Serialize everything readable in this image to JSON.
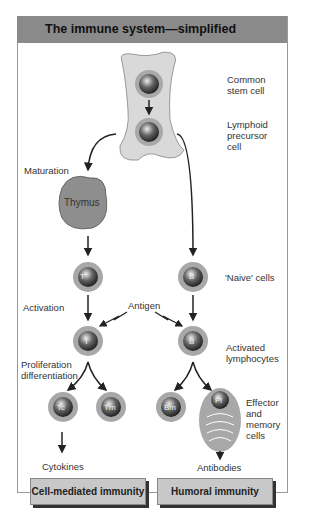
{
  "title": "The immune system—simplified",
  "labels": {
    "common_stem": "Common\nstem cell",
    "lymphoid": "Lymphoid\nprecursor\ncell",
    "maturation": "Maturation",
    "thymus": "Thymus",
    "naive": "'Naive' cells",
    "activation": "Activation",
    "antigen": "Antigen",
    "activated": "Activated\nlymphocytes",
    "proliferation": "Proliferation\ndifferentiation",
    "effector": "Effector\nand\nmemory\ncells",
    "cytokines": "Cytokines",
    "antibodies": "Antibodies"
  },
  "cells": {
    "t": "T",
    "b": "B",
    "tc": "Tc",
    "tm": "Tm",
    "bm": "Bm",
    "pl": "Pl"
  },
  "boxes": {
    "cell_mediated": "Cell-mediated immunity",
    "humoral": "Humoral immunity"
  },
  "colors": {
    "header": "#8a8a8a",
    "bone": "#d9d9d9",
    "ring": "#a8a8a8",
    "nucleus": "#555555"
  }
}
